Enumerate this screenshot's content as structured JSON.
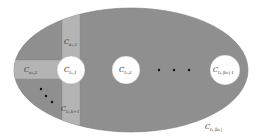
{
  "diagram": {
    "colors": {
      "background": "#ffffff",
      "ellipse_fill": "#8f8f8f",
      "strip_fill": "#b4b4b4",
      "ellipse_stroke": "#7a7a7a",
      "circle_fill": "#ffffff",
      "dot": "#111111",
      "text": "#333333"
    },
    "ellipse": {
      "cx": 131,
      "cy": 70,
      "rx": 117,
      "ry": 62
    },
    "vertical_strip": {
      "x": 62,
      "width": 18
    },
    "horizontal_strip": {
      "y": 60,
      "height": 19
    },
    "circles": [
      {
        "id": "c1",
        "cx": 71,
        "cy": 70,
        "r": 14,
        "label": {
          "base": "C",
          "sub": "t₁,1"
        }
      },
      {
        "id": "c2",
        "cx": 126,
        "cy": 70,
        "r": 14,
        "label": {
          "base": "C",
          "sub": "t₁,2"
        }
      },
      {
        "id": "c3",
        "cx": 225,
        "cy": 70,
        "r": 15,
        "label": {
          "base": "C",
          "sub": "t₁,|b₁|-1"
        }
      }
    ],
    "horizontal_dots": [
      {
        "cx": 159,
        "cy": 70
      },
      {
        "cx": 174,
        "cy": 70
      },
      {
        "cx": 189,
        "cy": 70
      }
    ],
    "diagonal_dots": [
      {
        "cx": 41,
        "cy": 89
      },
      {
        "cx": 46,
        "cy": 96
      },
      {
        "cx": 52,
        "cy": 102
      }
    ],
    "region_labels": [
      {
        "id": "strip-top",
        "x": 64,
        "y": 43,
        "base": "C",
        "sub": "e₁,1"
      },
      {
        "id": "strip-left",
        "x": 24,
        "y": 73,
        "base": "C",
        "sub": "e₁,2"
      },
      {
        "id": "strip-bottom",
        "x": 61,
        "y": 111,
        "base": "C",
        "sub": "t₁,k+1"
      },
      {
        "id": "outer",
        "x": 205,
        "y": 128,
        "base": "C",
        "sub": "t₁,|b₁|"
      }
    ]
  }
}
